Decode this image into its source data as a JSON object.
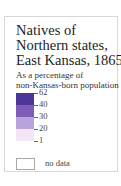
{
  "legend": {
    "title_lines": [
      "Natives of",
      "Northern states,",
      "East Kansas, 1865"
    ],
    "subtitle_lines": [
      "As a percentage of",
      "non-Kansas-born population"
    ],
    "classes": [
      {
        "color": "#4b3596"
      },
      {
        "color": "#7c5cb6"
      },
      {
        "color": "#b8a3da"
      },
      {
        "color": "#f4e6f7"
      }
    ],
    "breaks": [
      "62",
      "40",
      "30",
      "20",
      "1"
    ],
    "no_data_label": "no data"
  }
}
